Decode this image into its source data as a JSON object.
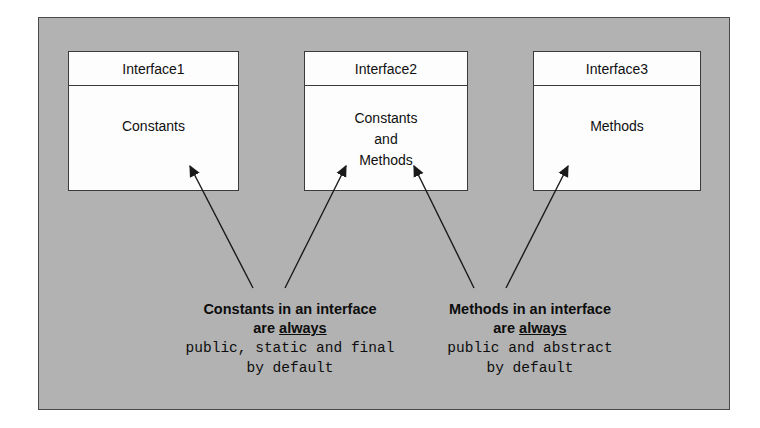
{
  "diagram": {
    "background_color": "#b2b2b2",
    "box_fill_color": "#fdfdfd",
    "line_color": "#3b3b3b",
    "interfaces": [
      {
        "name": "Interface1",
        "members": [
          "Constants"
        ]
      },
      {
        "name": "Interface2",
        "members": [
          "Constants",
          "and",
          "Methods"
        ]
      },
      {
        "name": "Interface3",
        "members": [
          "Methods"
        ]
      }
    ],
    "annotations": [
      {
        "id": "constants-note",
        "line1": "Constants in an interface",
        "line2_prefix": "are ",
        "line2_underlined": "always",
        "line3": "public, static and final",
        "line4": "by default"
      },
      {
        "id": "methods-note",
        "line1": "Methods in an interface",
        "line2_prefix": "are ",
        "line2_underlined": "always",
        "line3": "public and abstract",
        "line4": "by default"
      }
    ]
  }
}
